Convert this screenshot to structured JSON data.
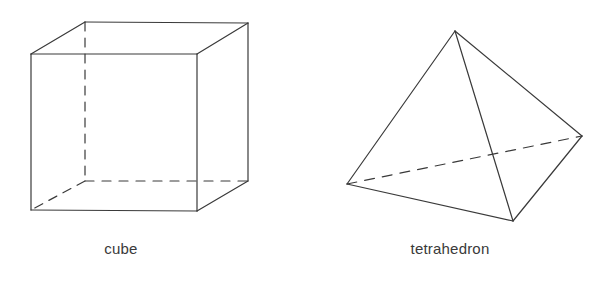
{
  "page": {
    "background_color": "#ffffff",
    "width": 609,
    "height": 288,
    "stroke_color": "#3a3a3a",
    "text_color": "#3a3a3a",
    "stroke_width": 1.2
  },
  "figures": [
    {
      "name": "cube",
      "caption": "cube",
      "shape_type": "cube",
      "vertices": {
        "front_top_left": [
          31,
          54
        ],
        "front_top_right": [
          197,
          54
        ],
        "front_bottom_left": [
          31,
          210
        ],
        "front_bottom_right": [
          197,
          211
        ],
        "back_top_left": [
          85,
          22
        ],
        "back_top_right": [
          248,
          23
        ],
        "back_bottom_left": [
          85,
          181
        ],
        "back_bottom_right": [
          248,
          181
        ]
      },
      "solid_edges": [
        "front_top_left-front_top_right",
        "front_top_right-front_bottom_right",
        "front_bottom_right-front_bottom_left",
        "front_bottom_left-front_top_left",
        "back_top_left-back_top_right",
        "back_top_right-back_bottom_right",
        "front_top_left-back_top_left",
        "front_top_right-back_top_right",
        "front_bottom_right-back_bottom_right"
      ],
      "dashed_edges": [
        "back_top_left-back_bottom_left",
        "back_bottom_left-back_bottom_right",
        "back_bottom_left-front_bottom_left"
      ]
    },
    {
      "name": "tetrahedron",
      "caption": "tetrahedron",
      "shape_type": "tetrahedron",
      "vertices": {
        "apex": [
          455,
          31
        ],
        "left": [
          347,
          184
        ],
        "front": [
          513,
          221
        ],
        "right": [
          582,
          136
        ]
      },
      "solid_edges": [
        "apex-left",
        "apex-front",
        "apex-right",
        "left-front",
        "front-right"
      ],
      "dashed_edges": [
        "left-right"
      ]
    }
  ]
}
